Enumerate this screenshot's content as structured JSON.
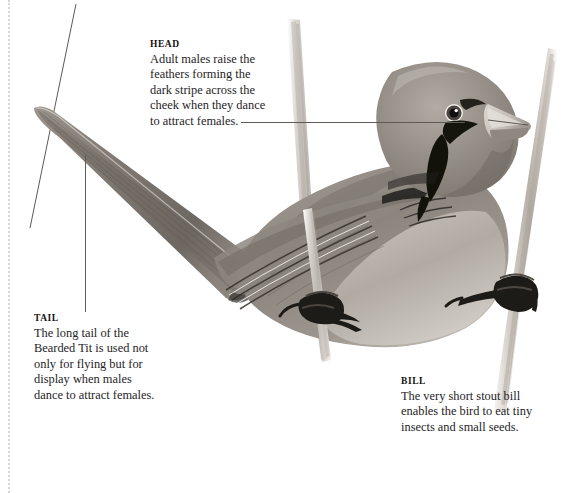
{
  "plate": {
    "subject": "Bearded Tit",
    "background_color": "#ffffff",
    "ink_color": "#26231f",
    "leader_color": "#5d5a56",
    "margin_rule_color": "#d9d7d4"
  },
  "callouts": {
    "head": {
      "title": "HEAD",
      "lines": [
        "Adult males raise the",
        "feathers forming the",
        "dark stripe across the",
        "cheek when they dance",
        "to attract females."
      ]
    },
    "tail": {
      "title": "TAIL",
      "lines": [
        "The long tail of the",
        "Bearded Tit is used not",
        "only for flying but for",
        "display when males",
        "dance to attract females."
      ]
    },
    "bill": {
      "title": "BILL",
      "lines": [
        "The very short stout bill",
        "enables the bird to eat tiny",
        "insects and small seeds."
      ]
    }
  },
  "artwork": {
    "description": "Graphite illustration of a Bearded Tit perched across two reed stems",
    "elements": [
      "bearded-tit-body",
      "bearded-tit-head",
      "bearded-tit-tail",
      "bearded-tit-bill",
      "bearded-tit-eye",
      "bearded-tit-moustache-stripe",
      "bearded-tit-wing",
      "bearded-tit-foot-left",
      "bearded-tit-foot-right",
      "reed-stem-left",
      "reed-stem-right"
    ]
  }
}
